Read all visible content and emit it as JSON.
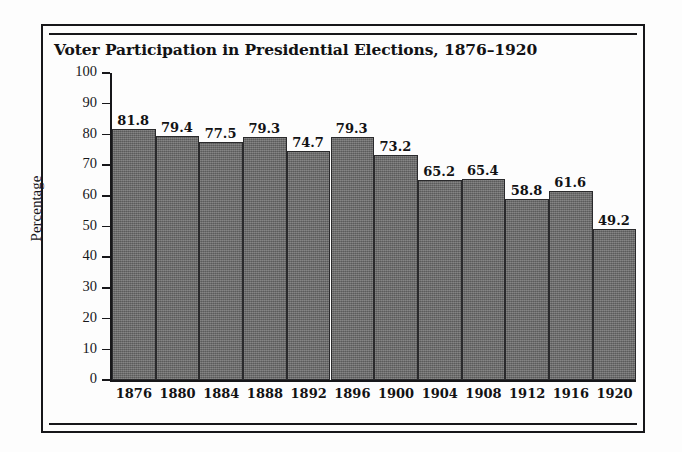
{
  "chart_data": {
    "type": "bar",
    "title": "Voter Participation in Presidential Elections, 1876–1920",
    "xlabel": "",
    "ylabel": "Percentage",
    "ylim": [
      0,
      100
    ],
    "ytick_step": 10,
    "grid": false,
    "legend": false,
    "bar_color": "#6d6d6d",
    "categories": [
      "1876",
      "1880",
      "1884",
      "1888",
      "1892",
      "1896",
      "1900",
      "1904",
      "1908",
      "1912",
      "1916",
      "1920"
    ],
    "values": [
      81.8,
      79.4,
      77.5,
      79.3,
      74.7,
      79.3,
      73.2,
      65.2,
      65.4,
      58.8,
      61.6,
      49.2
    ],
    "value_labels": [
      "81.8",
      "79.4",
      "77.5",
      "79.3",
      "74.7",
      "79.3",
      "73.2",
      "65.2",
      "65.4",
      "58.8",
      "61.6",
      "49.2"
    ],
    "ytick_labels": [
      "0",
      "10",
      "20",
      "30",
      "40",
      "50",
      "60",
      "70",
      "80",
      "90",
      "100"
    ]
  }
}
